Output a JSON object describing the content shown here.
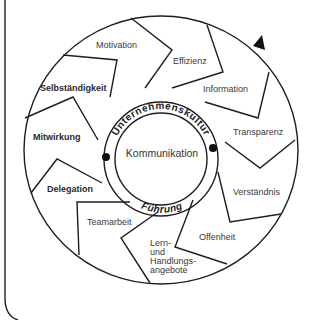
{
  "diagram": {
    "center": {
      "label": "Kommunikation"
    },
    "ring": {
      "top_label": "Unternehmenskultur",
      "bottom_label": "Führung"
    },
    "segments": [
      {
        "id": "motivation",
        "label": "Motivation",
        "bold": false
      },
      {
        "id": "effizienz",
        "label": "Effizienz",
        "bold": false
      },
      {
        "id": "information",
        "label": "Information",
        "bold": false
      },
      {
        "id": "transparenz",
        "label": "Transparenz",
        "bold": false
      },
      {
        "id": "verstaendnis",
        "label": "Verständnis",
        "bold": false
      },
      {
        "id": "offenheit",
        "label": "Offenheit",
        "bold": false
      },
      {
        "id": "lern",
        "label_lines": [
          "Lern-",
          "und",
          "Handlungs-",
          "angebote"
        ],
        "bold": false
      },
      {
        "id": "teamarbeit",
        "label": "Teamarbeit",
        "bold": false
      },
      {
        "id": "delegation",
        "label": "Delegation",
        "bold": true
      },
      {
        "id": "mitwirkung",
        "label": "Mitwirkung",
        "bold": true
      },
      {
        "id": "selbstaendigkeit",
        "label": "Selbständigkeit",
        "bold": true
      }
    ],
    "direction": "clockwise",
    "colors": {
      "line": "#1e1e1e",
      "text": "#333333",
      "background": "#ffffff"
    }
  }
}
